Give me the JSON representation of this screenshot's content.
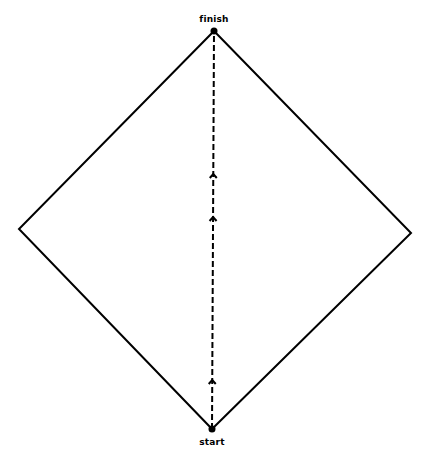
{
  "diagram": {
    "title": "",
    "shape": "diamond",
    "colors": {
      "stroke": "#000000",
      "background": "#ffffff"
    },
    "vertices": {
      "top": [
        214,
        31
      ],
      "right": [
        411,
        233
      ],
      "bottom": [
        212,
        429
      ],
      "left": [
        19,
        229
      ]
    },
    "nodes": [
      {
        "id": "finish",
        "label": "finish",
        "x": 214,
        "y": 31,
        "label_x": 214,
        "label_y": 14
      },
      {
        "id": "start",
        "label": "start",
        "x": 212,
        "y": 429,
        "label_x": 212,
        "label_y": 437
      }
    ],
    "path": {
      "from": "start",
      "to": "finish",
      "style": "dashed",
      "direction": "up",
      "arrowheads_y": [
        380,
        217,
        174
      ]
    }
  }
}
